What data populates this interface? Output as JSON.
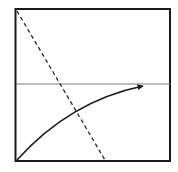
{
  "diagram": {
    "colors": {
      "background": "#ffffff",
      "frame": "#1a1a1a",
      "reference_line": "#7a7a7a",
      "dashed_line": "#2a2a2a",
      "arrow": "#1a1a1a"
    },
    "elements": [
      {
        "name": "frame",
        "style": "solid"
      },
      {
        "name": "horizontal-reference-line",
        "style": "thin solid"
      },
      {
        "name": "dashed-diagonal-line",
        "style": "dashed"
      },
      {
        "name": "curved-arrow",
        "style": "solid with arrowhead"
      }
    ]
  }
}
